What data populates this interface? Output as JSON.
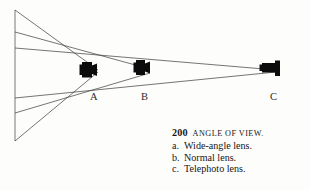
{
  "figure": {
    "name": "angle-of-view-diagram",
    "background_color": "#fdfdfc",
    "line_color": "#3a3a3a",
    "camera_color": "#0c0c0c"
  },
  "diagram": {
    "subject_plane": {
      "label": "subject-plane",
      "x": 15,
      "y_top": 10,
      "y_bottom": 141
    },
    "cameras": [
      {
        "id": "A",
        "label": "A",
        "lens_type": "wide-angle",
        "label_x": 92,
        "label_y": 95,
        "body_x": 82,
        "body_y": 62,
        "body_w": 14,
        "body_h": 15
      },
      {
        "id": "B",
        "label": "B",
        "lens_type": "normal",
        "label_x": 143,
        "label_y": 95,
        "body_x": 136,
        "body_y": 60,
        "body_w": 13,
        "body_h": 14
      },
      {
        "id": "C",
        "label": "C",
        "lens_type": "telephoto",
        "label_x": 272,
        "label_y": 95,
        "body_x": 262,
        "body_y": 63,
        "body_w": 13,
        "body_h": 14
      }
    ],
    "rays": [
      {
        "name": "ray-wide-upper",
        "x1": 15,
        "y1": 10,
        "x2": 98,
        "y2": 70
      },
      {
        "name": "ray-normal-upper",
        "x1": 15,
        "y1": 32,
        "x2": 150,
        "y2": 69
      },
      {
        "name": "ray-tele-upper",
        "x1": 15,
        "y1": 48,
        "x2": 276,
        "y2": 70
      },
      {
        "name": "ray-tele-lower",
        "x1": 15,
        "y1": 98,
        "x2": 276,
        "y2": 72
      },
      {
        "name": "ray-normal-lower",
        "x1": 15,
        "y1": 113,
        "x2": 150,
        "y2": 73
      },
      {
        "name": "ray-wide-lower",
        "x1": 15,
        "y1": 141,
        "x2": 98,
        "y2": 72
      }
    ]
  },
  "caption": {
    "number": "200",
    "title": "ANGLE OF VIEW.",
    "items": [
      {
        "marker": "a.",
        "text": "Wide-angle lens."
      },
      {
        "marker": "b.",
        "text": "Normal lens."
      },
      {
        "marker": "c.",
        "text": "Telephoto lens."
      }
    ]
  }
}
